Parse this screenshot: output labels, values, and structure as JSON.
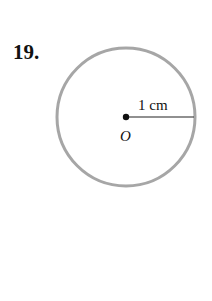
{
  "problem": {
    "number": "19."
  },
  "diagram": {
    "center_label": "O",
    "radius_label": "1 cm",
    "circle_color": "#a6a6a6"
  }
}
